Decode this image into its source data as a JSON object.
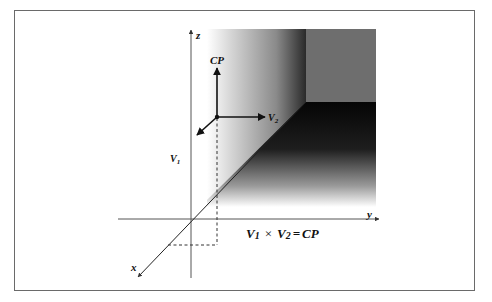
{
  "diagram": {
    "axes": {
      "x_label": "x",
      "y_label": "y",
      "z_label": "z"
    },
    "vectors": {
      "v1_label": "V",
      "v1_sub": "1",
      "v2_label": "V",
      "v2_sub": "2",
      "cp_label": "CP"
    },
    "equation": {
      "v1": "V",
      "v1_sub": "1",
      "times": "×",
      "v2": "V",
      "v2_sub": "2",
      "equals": "=",
      "result": "CP"
    },
    "colors": {
      "frame": "#6a6a6a",
      "axis": "#444444",
      "vector": "#111111",
      "plane_dark": "#0a0a0a",
      "plane_grey": "#6e6e6e",
      "plane_light": "#ffffff"
    }
  }
}
